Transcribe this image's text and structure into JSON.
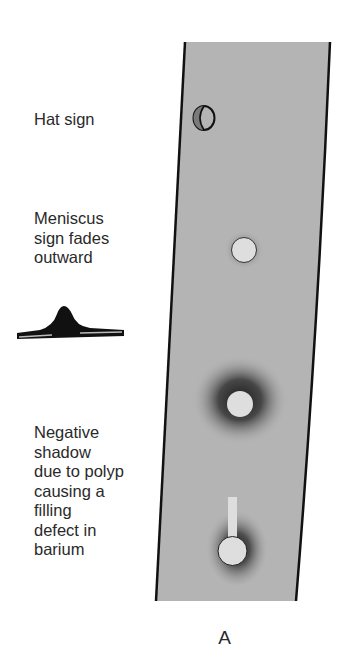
{
  "labels": {
    "hat_sign": "Hat sign",
    "meniscus": [
      "Meniscus",
      "sign fades",
      "outward"
    ],
    "negative_shadow": [
      "Negative",
      "shadow",
      "due to polyp",
      "causing a",
      "filling",
      "defect in",
      "barium"
    ]
  },
  "caption": "A",
  "colors": {
    "strip_fill": "#b4b4b4",
    "strip_border": "#111111",
    "polyp_fill": "#dedede",
    "hat_fill": "#7a7a7a"
  }
}
